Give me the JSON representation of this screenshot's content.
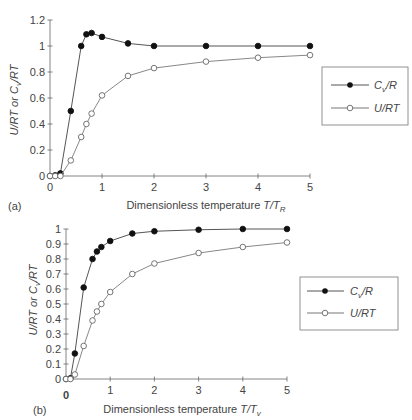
{
  "chart_data": [
    {
      "panel": "(a)",
      "type": "line",
      "title": "",
      "xlabel": "Dimensionless temperature T/T_R",
      "xlabel_main": "Dimensionless temperature ",
      "xlabel_var": "T/T",
      "xlabel_sub": "R",
      "ylabel": "U/RT or C_v/RT",
      "xlim": [
        0,
        5
      ],
      "ylim": [
        0,
        1.2
      ],
      "xticks": [
        0,
        1,
        2,
        3,
        4,
        5
      ],
      "yticks": [
        0,
        0.2,
        0.4,
        0.6,
        0.8,
        1,
        1.2
      ],
      "ytick_labels": [
        "0",
        "0.2",
        "0.4",
        "0.6",
        "0.8",
        "1",
        "1.2"
      ],
      "grid": false,
      "legend_position": "right",
      "series": [
        {
          "name": "C_v/R",
          "label": "Cv/R",
          "marker": "filled-circle",
          "x": [
            0,
            0.1,
            0.2,
            0.4,
            0.6,
            0.7,
            0.8,
            1.0,
            1.5,
            2,
            3,
            4,
            5
          ],
          "values": [
            0,
            0.005,
            0.02,
            0.5,
            1.0,
            1.09,
            1.1,
            1.07,
            1.02,
            1.0,
            1.0,
            1.0,
            1.0
          ]
        },
        {
          "name": "U/RT",
          "label": "U/RT",
          "marker": "open-circle",
          "x": [
            0,
            0.1,
            0.2,
            0.4,
            0.6,
            0.7,
            0.8,
            1.0,
            1.5,
            2,
            3,
            4,
            5
          ],
          "values": [
            0,
            0,
            0,
            0.12,
            0.3,
            0.4,
            0.48,
            0.62,
            0.77,
            0.83,
            0.88,
            0.91,
            0.93
          ]
        }
      ]
    },
    {
      "panel": "(b)",
      "type": "line",
      "title": "",
      "xlabel": "Dimensionless temperature T/T_v",
      "xlabel_main": "Dimensionless temperature ",
      "xlabel_var": "T/T",
      "xlabel_sub": "v",
      "ylabel": "U/RT or C_v/RT",
      "xlim": [
        0,
        5
      ],
      "ylim": [
        0,
        1
      ],
      "xticks": [
        0,
        1,
        2,
        3,
        4,
        5
      ],
      "yticks": [
        0,
        0.1,
        0.2,
        0.3,
        0.4,
        0.5,
        0.6,
        0.7,
        0.8,
        0.9,
        1
      ],
      "ytick_labels": [
        "0",
        "0.1",
        "0.2",
        "0.3",
        "0.4",
        "0.5",
        "0.6",
        "0.7",
        "0.8",
        "0.9",
        "1"
      ],
      "grid": false,
      "legend_position": "right",
      "series": [
        {
          "name": "C_v/R",
          "label": "Cv/R",
          "marker": "filled-circle",
          "x": [
            0,
            0.1,
            0.2,
            0.4,
            0.6,
            0.7,
            0.8,
            1.0,
            1.5,
            2,
            3,
            4,
            5
          ],
          "values": [
            0,
            0.005,
            0.17,
            0.61,
            0.8,
            0.85,
            0.88,
            0.92,
            0.97,
            0.985,
            0.995,
            1.0,
            1.0
          ]
        },
        {
          "name": "U/RT",
          "label": "U/RT",
          "marker": "open-circle",
          "x": [
            0,
            0.1,
            0.2,
            0.4,
            0.6,
            0.7,
            0.8,
            1.0,
            1.5,
            2,
            3,
            4,
            5
          ],
          "values": [
            0,
            0,
            0.03,
            0.22,
            0.39,
            0.45,
            0.5,
            0.58,
            0.7,
            0.77,
            0.84,
            0.88,
            0.91
          ]
        }
      ]
    }
  ],
  "labels": {
    "panel_a": "(a)",
    "panel_b": "(b)",
    "ylabel_a": "U/RT or C",
    "ylabel_b": "U/RT or C",
    "ylabel_sub": "v",
    "ylabel_tail": "/RT",
    "legend_cv_main": "C",
    "legend_cv_sub": "v",
    "legend_cv_tail": "/R",
    "legend_u": "U/RT",
    "b_extra_zero": "0"
  },
  "colors": {
    "line": "#555555",
    "axis": "#666666",
    "marker_fill": "#111111",
    "marker_open": "#ffffff"
  }
}
